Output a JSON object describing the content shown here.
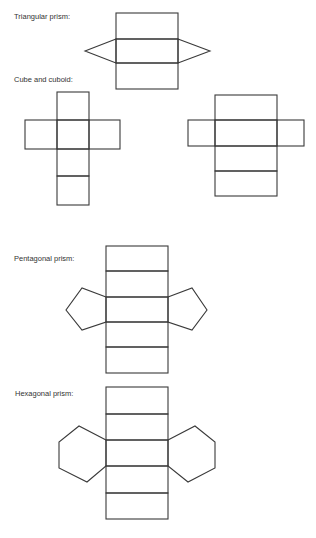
{
  "labels": {
    "triangular": "Triangular prism:",
    "cube_cuboid": "Cube and cuboid:",
    "pentagonal": "Pentagonal prism:",
    "hexagonal": "Hexagonal prism:"
  },
  "nets": [
    {
      "name": "triangular-prism-net",
      "rectangular_faces": 3,
      "end_faces": 2,
      "end_face_shape": "triangle"
    },
    {
      "name": "cube-net",
      "faces": 6,
      "face_shape": "square"
    },
    {
      "name": "cuboid-net",
      "faces": 6,
      "face_shape": "rectangle"
    },
    {
      "name": "pentagonal-prism-net",
      "rectangular_faces": 5,
      "end_faces": 2,
      "end_face_shape": "pentagon"
    },
    {
      "name": "hexagonal-prism-net",
      "rectangular_faces": 6,
      "end_faces": 2,
      "end_face_shape": "hexagon"
    }
  ],
  "colors": {
    "line": "#3a3a3a",
    "text": "#333333",
    "background": "#ffffff"
  }
}
